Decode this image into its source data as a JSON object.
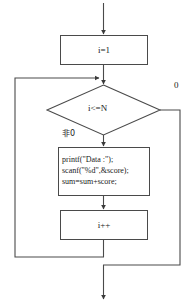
{
  "diagram": {
    "type": "flowchart",
    "stroke_color": "#4a4a4a",
    "text_color": "#1a1a1a",
    "background_color": "#ffffff"
  },
  "nodes": {
    "init": {
      "shape": "process",
      "text": "i=1"
    },
    "condition": {
      "shape": "decision",
      "text": "i<=N"
    },
    "body": {
      "shape": "process",
      "lines": [
        "printf(\"Data :\");",
        "scanf(\"%d\",&score);",
        "sum=sum+score;"
      ],
      "text": "printf(\"Data :\");\nscanf(\"%d\",&score);\nsum=sum+score;"
    },
    "increment": {
      "shape": "process",
      "text": "i++"
    }
  },
  "edge_labels": {
    "true_branch": "非0",
    "false_branch": "0"
  }
}
